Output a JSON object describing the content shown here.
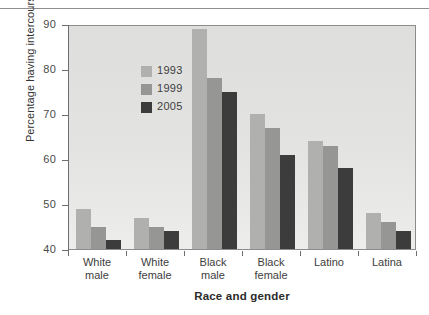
{
  "chart_data": {
    "type": "bar",
    "title": "",
    "xlabel": "Race and gender",
    "ylabel": "Percentage having intercourse",
    "ylim": [
      40,
      90
    ],
    "yticks": [
      40,
      50,
      60,
      70,
      80,
      90
    ],
    "ytick_labels": [
      "40",
      "50",
      "60",
      "70",
      "80",
      "90"
    ],
    "grid": false,
    "legend_position": "upper-left-inside",
    "categories": [
      "White male",
      "White female",
      "Black male",
      "Black female",
      "Latino",
      "Latina"
    ],
    "category_lines": [
      [
        "White",
        "male"
      ],
      [
        "White",
        "female"
      ],
      [
        "Black",
        "male"
      ],
      [
        "Black",
        "female"
      ],
      [
        "Latino",
        ""
      ],
      [
        "Latina",
        ""
      ]
    ],
    "series": [
      {
        "name": "1993",
        "color": "#b0b0ae",
        "values": [
          49,
          47,
          89,
          70,
          64,
          48
        ]
      },
      {
        "name": "1999",
        "color": "#969694",
        "values": [
          45,
          45,
          78,
          67,
          63,
          46
        ]
      },
      {
        "name": "2005",
        "color": "#3c3c3c",
        "values": [
          42,
          44,
          75,
          61,
          58,
          44
        ]
      }
    ]
  },
  "figure": {
    "plot_background": "#e3e3e1",
    "axis_color": "#6e6e6e",
    "top_rule_color": "#8f8f8f"
  }
}
